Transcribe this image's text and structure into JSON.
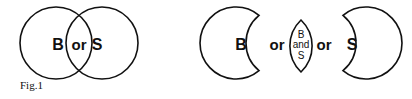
{
  "figure": {
    "caption": "Fig.1",
    "left_diagram": {
      "label_b": "B",
      "label_or": "or",
      "label_s": "S"
    },
    "right_diagram": {
      "label_b": "B",
      "label_or_1": "or",
      "lens_top": "B",
      "lens_mid": "and",
      "lens_bottom": "S",
      "label_or_2": "or",
      "label_s": "S"
    }
  }
}
